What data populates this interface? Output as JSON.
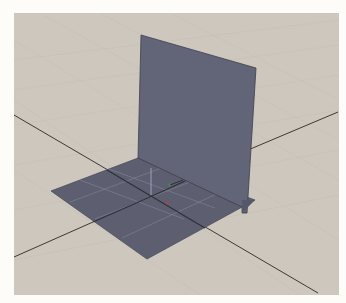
{
  "viewport": {
    "name": "3d-perspective-viewport",
    "background_color": "#cdc7bd",
    "ground_grid_color": "#c4beb3",
    "axis_line_color": "#3b3a37",
    "plane_color": "#5d5f70",
    "plane_edge_color": "#3e404d",
    "plane_grid_color": "#8d8fa0"
  },
  "objects": [
    {
      "name": "floor-plane",
      "type": "plane",
      "orientation": "horizontal"
    },
    {
      "name": "wall-plane",
      "type": "plane",
      "orientation": "vertical"
    }
  ],
  "gizmo": {
    "x_axis_color": "#b0404a",
    "y_axis_color": "#4f8a4f",
    "z_axis_color": "#9aa0c8"
  }
}
